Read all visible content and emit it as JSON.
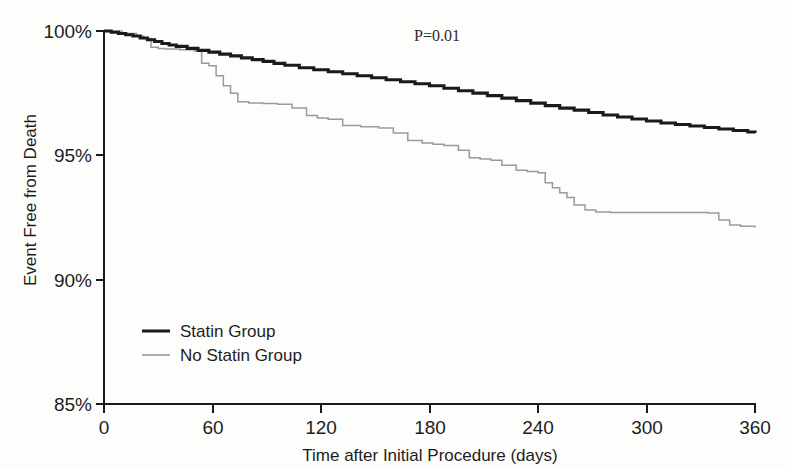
{
  "figure": {
    "background_color": "#fdfdfc",
    "axis_color": "#1a1a1a"
  },
  "annotation": {
    "pvalue_text": "P=0.01"
  },
  "legend": {
    "position": "inside-lower-left",
    "entries": [
      {
        "label": "Statin Group",
        "color": "#1a1a1a"
      },
      {
        "label": "No Statin Group",
        "color": "#9a9a9a"
      }
    ]
  },
  "chart_data": {
    "type": "line",
    "title": "",
    "subtitle": "",
    "xlabel": "Time after Initial Procedure (days)",
    "ylabel": "Event Free from Death",
    "xlim": [
      0,
      360
    ],
    "ylim": [
      85,
      100
    ],
    "xticks": [
      0,
      60,
      120,
      180,
      240,
      300,
      360
    ],
    "xtick_labels": [
      "0",
      "60",
      "120",
      "180",
      "240",
      "300",
      "360"
    ],
    "yticks": [
      85,
      90,
      95,
      100
    ],
    "ytick_labels": [
      "85%",
      "90%",
      "95%",
      "100%"
    ],
    "grid": false,
    "legend_position": "inside-lower-left",
    "annotations": [
      {
        "text": "P=0.01",
        "x": 205,
        "y": 99.6
      }
    ],
    "series": [
      {
        "name": "Statin Group",
        "color": "#1a1a1a",
        "style": "step",
        "linewidth": 3.1,
        "x": [
          0,
          4,
          8,
          12,
          16,
          20,
          24,
          28,
          32,
          36,
          40,
          46,
          52,
          58,
          64,
          70,
          76,
          82,
          88,
          94,
          100,
          108,
          116,
          124,
          132,
          140,
          148,
          156,
          164,
          172,
          180,
          188,
          196,
          204,
          212,
          220,
          228,
          236,
          244,
          252,
          260,
          268,
          276,
          284,
          292,
          300,
          308,
          316,
          324,
          332,
          340,
          348,
          356,
          360
        ],
        "y": [
          100.0,
          99.95,
          99.9,
          99.85,
          99.8,
          99.72,
          99.65,
          99.58,
          99.5,
          99.44,
          99.38,
          99.3,
          99.22,
          99.15,
          99.07,
          99.0,
          98.92,
          98.85,
          98.78,
          98.7,
          98.62,
          98.52,
          98.44,
          98.36,
          98.28,
          98.2,
          98.12,
          98.04,
          97.96,
          97.88,
          97.8,
          97.7,
          97.6,
          97.5,
          97.4,
          97.3,
          97.2,
          97.1,
          97.0,
          96.9,
          96.82,
          96.72,
          96.62,
          96.54,
          96.46,
          96.38,
          96.3,
          96.24,
          96.18,
          96.12,
          96.06,
          96.0,
          95.94,
          95.9
        ]
      },
      {
        "name": "No Statin Group",
        "color": "#9a9a9a",
        "style": "step",
        "linewidth": 1.5,
        "x": [
          0,
          10,
          18,
          22,
          26,
          30,
          34,
          42,
          50,
          54,
          58,
          62,
          66,
          70,
          74,
          80,
          88,
          96,
          104,
          112,
          118,
          124,
          132,
          142,
          152,
          160,
          168,
          176,
          182,
          188,
          196,
          202,
          208,
          214,
          220,
          228,
          234,
          240,
          244,
          248,
          252,
          256,
          260,
          266,
          272,
          280,
          300,
          320,
          334,
          340,
          346,
          352,
          360
        ],
        "y": [
          100.0,
          99.9,
          99.8,
          99.7,
          99.35,
          99.3,
          99.28,
          99.25,
          99.2,
          98.7,
          98.6,
          98.2,
          97.8,
          97.5,
          97.15,
          97.1,
          97.08,
          97.05,
          96.9,
          96.6,
          96.5,
          96.45,
          96.2,
          96.15,
          96.1,
          95.9,
          95.6,
          95.5,
          95.45,
          95.4,
          95.2,
          94.9,
          94.85,
          94.8,
          94.6,
          94.4,
          94.35,
          94.3,
          93.9,
          93.7,
          93.5,
          93.3,
          93.0,
          92.8,
          92.72,
          92.7,
          92.7,
          92.7,
          92.68,
          92.4,
          92.2,
          92.15,
          92.1
        ]
      }
    ]
  }
}
